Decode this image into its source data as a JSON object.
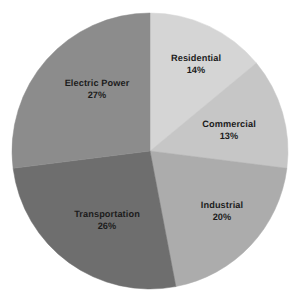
{
  "chart_data": {
    "type": "pie",
    "title": "",
    "subtitle": "",
    "xlabel": "",
    "ylabel": "",
    "legend": "none",
    "grid": false,
    "units": "percent",
    "start_angle_deg": 0,
    "direction": "clockwise",
    "categories": [
      "Residential",
      "Commercial",
      "Industrial",
      "Transportation",
      "Electric Power"
    ],
    "values": [
      14,
      13,
      20,
      26,
      27
    ],
    "labels_suffix": "%",
    "colors": [
      "#d5d5d5",
      "#c6c6c6",
      "#acacac",
      "#6e6e6e",
      "#8c8c8c"
    ],
    "background": "#ffffff",
    "label_color": "#1c1c1c",
    "slices": [
      {
        "name": "Residential",
        "value": 14,
        "value_text": "14%",
        "color": "#d5d5d5",
        "label_x": 196,
        "label_y": 65
      },
      {
        "name": "Commercial",
        "value": 13,
        "value_text": "13%",
        "color": "#c6c6c6",
        "label_x": 229,
        "label_y": 131
      },
      {
        "name": "Industrial",
        "value": 20,
        "value_text": "20%",
        "color": "#acacac",
        "label_x": 222,
        "label_y": 212
      },
      {
        "name": "Transportation",
        "value": 26,
        "value_text": "26%",
        "color": "#6e6e6e",
        "label_x": 107,
        "label_y": 221
      },
      {
        "name": "Electric Power",
        "value": 27,
        "value_text": "27%",
        "color": "#8c8c8c",
        "label_x": 97,
        "label_y": 90
      }
    ],
    "geometry": {
      "center_x": 150,
      "center_y": 151,
      "radius": 138
    }
  }
}
